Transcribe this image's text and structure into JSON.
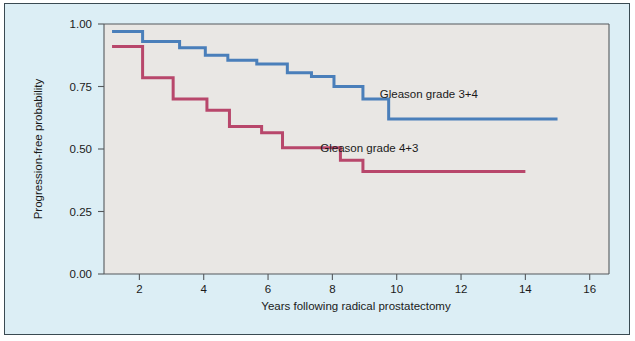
{
  "chart_data": {
    "type": "line",
    "subtype": "kaplan-meier-step",
    "title": "",
    "xlabel": "Years following radical prostatectomy",
    "ylabel": "Progression-free probability",
    "xlim": [
      0.9,
      16.6
    ],
    "ylim": [
      0.0,
      1.0
    ],
    "xticks": [
      2,
      4,
      6,
      8,
      10,
      12,
      14,
      16
    ],
    "xticklabels": [
      "2",
      "4",
      "6",
      "8",
      "10",
      "12",
      "14",
      "16"
    ],
    "yticks": [
      0.0,
      0.25,
      0.5,
      0.75,
      1.0
    ],
    "yticklabels": [
      "0.00",
      "0.25",
      "0.50",
      "0.75",
      "1.00"
    ],
    "grid": false,
    "legend_position": "inline-annotation",
    "series": [
      {
        "name": "Gleason grade 3+4",
        "color": "#4a7fba",
        "label": "Gleason grade 3+4",
        "label_x": 11.0,
        "label_y": 0.705,
        "steps": [
          {
            "x": 1.15,
            "y": 0.97
          },
          {
            "x": 2.1,
            "y": 0.93
          },
          {
            "x": 3.25,
            "y": 0.905
          },
          {
            "x": 4.05,
            "y": 0.875
          },
          {
            "x": 4.75,
            "y": 0.855
          },
          {
            "x": 5.65,
            "y": 0.84
          },
          {
            "x": 6.6,
            "y": 0.805
          },
          {
            "x": 7.35,
            "y": 0.79
          },
          {
            "x": 8.05,
            "y": 0.75
          },
          {
            "x": 8.95,
            "y": 0.7
          },
          {
            "x": 9.75,
            "y": 0.62
          },
          {
            "x": 15.0,
            "y": 0.62
          }
        ]
      },
      {
        "name": "Gleason grade 4+3",
        "color": "#b8476b",
        "label": "Gleason grade 4+3",
        "label_x": 9.15,
        "label_y": 0.49,
        "steps": [
          {
            "x": 1.15,
            "y": 0.91
          },
          {
            "x": 2.1,
            "y": 0.785
          },
          {
            "x": 3.05,
            "y": 0.7
          },
          {
            "x": 4.1,
            "y": 0.655
          },
          {
            "x": 4.8,
            "y": 0.59
          },
          {
            "x": 5.8,
            "y": 0.565
          },
          {
            "x": 6.45,
            "y": 0.505
          },
          {
            "x": 8.25,
            "y": 0.455
          },
          {
            "x": 8.95,
            "y": 0.41
          },
          {
            "x": 14.0,
            "y": 0.41
          }
        ]
      }
    ]
  },
  "axes": {
    "y_axis_title": "Progression-free probability",
    "x_axis_title": "Years following radical prostatectomy"
  },
  "colors": {
    "blue_series": "#4a7fba",
    "red_series": "#b8476b",
    "panel_background": "#e9e7e4",
    "figure_background": "#dceef5",
    "axis_line": "#55595c",
    "frame_border": "#3a4a52"
  }
}
